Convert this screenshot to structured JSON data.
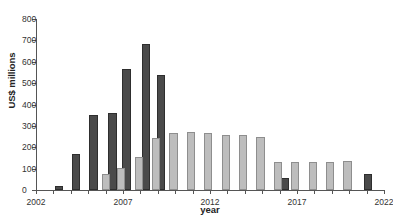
{
  "chart_data": {
    "type": "bar",
    "title": "",
    "xlabel": "year",
    "ylabel": "US$ millions",
    "ylim": [
      0,
      800
    ],
    "yticks": [
      0,
      100,
      200,
      300,
      400,
      500,
      600,
      700,
      800
    ],
    "xlim": [
      2002,
      2022
    ],
    "xticks": [
      2002,
      2007,
      2012,
      2017,
      2022
    ],
    "xtick_labels": [
      "2002",
      "2007",
      "2012",
      "2017",
      "2022"
    ],
    "grid": false,
    "legend": "none",
    "series": [
      {
        "name": "dark",
        "color": "#4a4a4a",
        "points": [
          {
            "x": 2003.3,
            "value": 18
          },
          {
            "x": 2004.3,
            "value": 170
          },
          {
            "x": 2005.3,
            "value": 350
          },
          {
            "x": 2006.4,
            "value": 362
          },
          {
            "x": 2007.2,
            "value": 565
          },
          {
            "x": 2008.3,
            "value": 684
          },
          {
            "x": 2009.2,
            "value": 538
          },
          {
            "x": 2016.3,
            "value": 55
          },
          {
            "x": 2021.1,
            "value": 75
          }
        ]
      },
      {
        "name": "light",
        "color": "#bdbdbd",
        "points": [
          {
            "x": 2006.0,
            "value": 73
          },
          {
            "x": 2006.9,
            "value": 101
          },
          {
            "x": 2007.9,
            "value": 154
          },
          {
            "x": 2008.9,
            "value": 242
          },
          {
            "x": 2009.9,
            "value": 268
          },
          {
            "x": 2010.9,
            "value": 272
          },
          {
            "x": 2011.9,
            "value": 268
          },
          {
            "x": 2012.9,
            "value": 259
          },
          {
            "x": 2013.9,
            "value": 256
          },
          {
            "x": 2014.9,
            "value": 250
          },
          {
            "x": 2015.9,
            "value": 131
          },
          {
            "x": 2016.9,
            "value": 133
          },
          {
            "x": 2017.9,
            "value": 132
          },
          {
            "x": 2018.9,
            "value": 132
          },
          {
            "x": 2019.9,
            "value": 136
          }
        ]
      }
    ]
  },
  "title_strip": {
    "text": ""
  }
}
